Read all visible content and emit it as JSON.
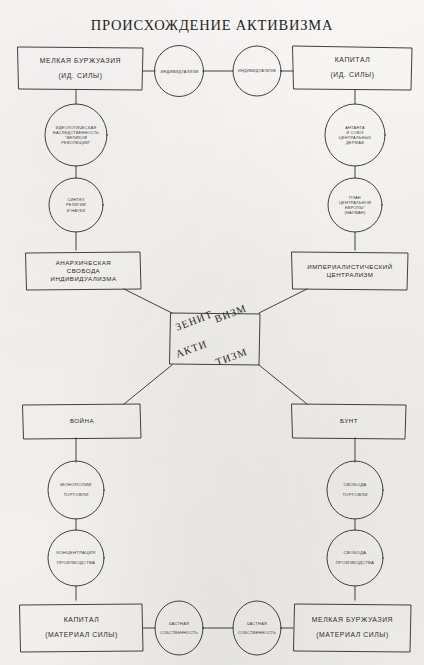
{
  "title": "ПРОИСХОЖДЕНИЕ АКТИВИЗМА",
  "center": {
    "word_top_left": "ЗЕНИТ",
    "word_top_right": "ВИЗМ",
    "word_bottom_left": "АКТИ",
    "word_bottom_right": "ТИЗМ",
    "full_words": [
      "ЗЕНИТИЗМ",
      "АКТИВИЗМ"
    ]
  },
  "boxes": {
    "top_left": {
      "line1": "МЕЛКАЯ БУРЖУАЗИЯ",
      "line2": "(ИД. СИЛЫ)"
    },
    "top_right": {
      "line1": "КАПИТАЛ",
      "line2": "(ИД. СИЛЫ)"
    },
    "mid_left": {
      "line1": "АНАРХИЧЕСКАЯ",
      "line2": "СВОБОДА",
      "line3": "ИНДИВИДУАЛИЗМА"
    },
    "mid_right": {
      "line1": "ИМПЕРИАЛИСТИЧЕСКИЙ",
      "line2": "ЦЕНТРАЛИЗМ"
    },
    "lower_left": {
      "line1": "ВОЙНА"
    },
    "lower_right": {
      "line1": "БУНТ"
    },
    "bottom_left": {
      "line1": "КАПИТАЛ",
      "line2": "(МАТЕРИАЛ СИЛЫ)"
    },
    "bottom_right": {
      "line1": "МЕЛКАЯ БУРЖУАЗИЯ",
      "line2": "(МАТЕРИАЛ СИЛЫ)"
    }
  },
  "circles": {
    "top_individualism_left": {
      "line1": "ИНДИВИДУАЛИЗМ"
    },
    "top_individualism_right": {
      "line1": "ИНДИВИДУАЛИЗМ"
    },
    "ideological": {
      "line1": "ИДЕОЛОГИЧЕСКАЯ",
      "line2": "НАСЛЕДСТВЕННОСТЬ",
      "line3": "\"ВЕЛИКОЙ",
      "line4": "РЕВОЛЮЦИИ\""
    },
    "synthesis": {
      "line1": "СИНТЕЗ",
      "line2": "РЕЛИГИИ",
      "line3": "И НАУКИ"
    },
    "antanta": {
      "line1": "АНТАНТА",
      "line2": "И СОЮЗ",
      "line3": "ЦЕНТРАЛЬНЫХ",
      "line4": "ДЕРЖАВ"
    },
    "plan_europe": {
      "line1": "ПЛАН",
      "line2": "ЦЕНТРАЛЬНОЙ",
      "line3": "ЕВРОПЫ\"",
      "line4": "(НАУМАН)"
    },
    "trade_monopoly": {
      "line1": "МОНОПОЛИИ",
      "line2": "ТОРГОВЛИ"
    },
    "production_concentration": {
      "line1": "КОНЦЕНТРАЦИЯ",
      "line2": "ПРОИЗВОДСТВА"
    },
    "trade_freedom": {
      "line1": "СВОБОДА",
      "line2": "ТОРГОВЛИ"
    },
    "production_freedom": {
      "line1": "СВОБОДА",
      "line2": "ПРОИЗВОДСТВА"
    },
    "private_property_left": {
      "line1": "ЧАСТНАЯ",
      "line2": "СОБСТВЕННОСТЬ"
    },
    "private_property_right": {
      "line1": "ЧАСТНАЯ",
      "line2": "СОБСТВЕННОСТЬ"
    }
  },
  "style": {
    "ink": "#2e2d2b",
    "paper": "#f4f3f0",
    "stroke_width": 0.9
  }
}
